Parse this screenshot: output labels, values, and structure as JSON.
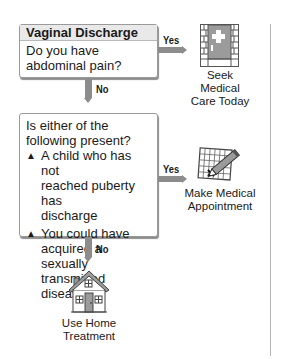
{
  "flowchart": {
    "title": "Vaginal Discharge",
    "question1": {
      "text": "Do you have abdominal pain?",
      "yes_label": "Yes",
      "no_label": "No",
      "yes_outcome": {
        "icon": "hospital-door-icon",
        "line1": "Seek Medical",
        "line2": "Care Today"
      }
    },
    "question2": {
      "intro_line1": "Is either of the",
      "intro_line2": "following present?",
      "bullets": [
        {
          "marker": "▲",
          "line1": "A child who has not",
          "line2": "reached puberty has",
          "line3": "discharge"
        },
        {
          "marker": "▲",
          "line1": "You could have",
          "line2": "acquired a sexually",
          "line3": "transmitted disease"
        }
      ],
      "yes_label": "Yes",
      "no_label": "No",
      "yes_outcome": {
        "icon": "calendar-pencil-icon",
        "line1": "Make Medical",
        "line2": "Appointment"
      },
      "no_outcome": {
        "icon": "house-icon",
        "line1": "Use Home",
        "line2": "Treatment"
      }
    },
    "colors": {
      "arrow": "#8c8c8c",
      "header_bg": "#e9e9e9",
      "border": "#9a9a9a",
      "icon_gray": "#9b9b9b"
    }
  }
}
